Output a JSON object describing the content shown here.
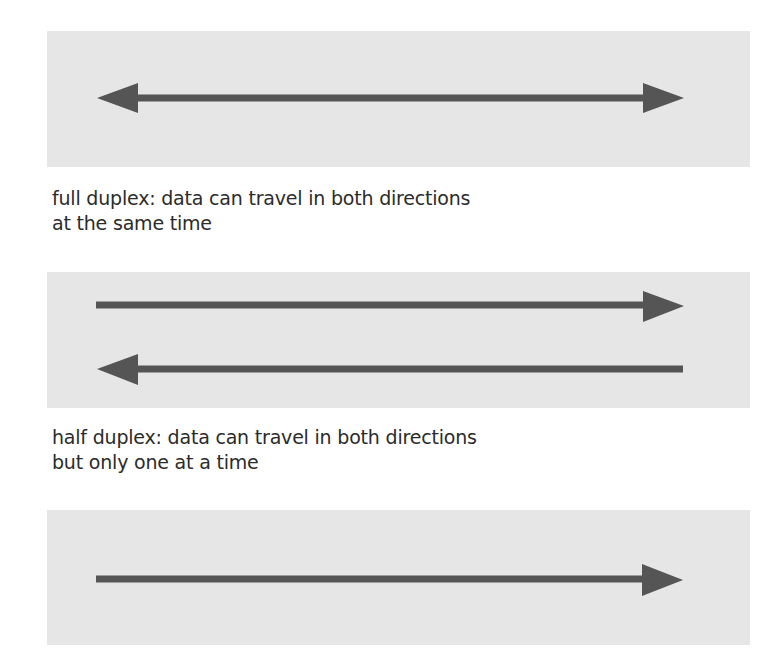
{
  "colors": {
    "panel_background": "#e6e6e6",
    "arrow": "#555555",
    "text": "#2b2b2b"
  },
  "panels": [
    {
      "id": "full-duplex",
      "arrows": [
        {
          "direction": "bidirectional",
          "icon": "double-headed-arrow-icon"
        }
      ]
    },
    {
      "id": "half-duplex",
      "arrows": [
        {
          "direction": "right",
          "icon": "right-arrow-icon"
        },
        {
          "direction": "left",
          "icon": "left-arrow-icon"
        }
      ]
    },
    {
      "id": "simplex",
      "arrows": [
        {
          "direction": "right",
          "icon": "right-arrow-icon"
        }
      ]
    }
  ],
  "captions": {
    "full_duplex": {
      "line1": "full duplex: data can travel in both directions",
      "line2": "at the same time"
    },
    "half_duplex": {
      "line1": "half duplex: data can travel in both directions",
      "line2": "but only one at a time"
    }
  }
}
